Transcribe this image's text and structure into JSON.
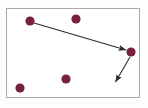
{
  "figure": {
    "canvas": {
      "width": 148,
      "height": 108,
      "background": "#fdfdfd"
    },
    "frame": {
      "name": "diagram-border",
      "x": 6,
      "y": 8,
      "width": 134,
      "height": 90,
      "stroke": "#a9a9ad",
      "stroke_width": 1,
      "fill": "#ffffff"
    },
    "colors": {
      "dot": "#77213f",
      "dot_dark": "#5e1a31",
      "arrow": "#2b2b2b",
      "border": "#a9a9ad",
      "page_background": "#fdfdfd",
      "plot_background": "#ffffff"
    },
    "nodes": [
      {
        "id": "p1",
        "label": "",
        "cx": 30,
        "cy": 21,
        "r": 4.6
      },
      {
        "id": "p2",
        "label": "",
        "cx": 76,
        "cy": 19,
        "r": 4.6
      },
      {
        "id": "p3",
        "label": "",
        "cx": 131,
        "cy": 52,
        "r": 4.6
      },
      {
        "id": "p4",
        "label": "",
        "cx": 66,
        "cy": 79,
        "r": 4.6
      },
      {
        "id": "p5",
        "label": "",
        "cx": 20,
        "cy": 88,
        "r": 4.6
      }
    ],
    "arrows": [
      {
        "id": "a1",
        "label": "",
        "from": "p1",
        "to": "p3",
        "x1": 34,
        "y1": 23,
        "x2": 126,
        "y2": 50,
        "stroke_width": 1.1,
        "head_length": 7.5,
        "head_width": 4.4
      },
      {
        "id": "a2",
        "label": "",
        "from": "p3",
        "to": "",
        "x1": 130,
        "y1": 57,
        "x2": 115.5,
        "y2": 82,
        "stroke_width": 1.1,
        "head_length": 7.5,
        "head_width": 4.4
      }
    ]
  }
}
